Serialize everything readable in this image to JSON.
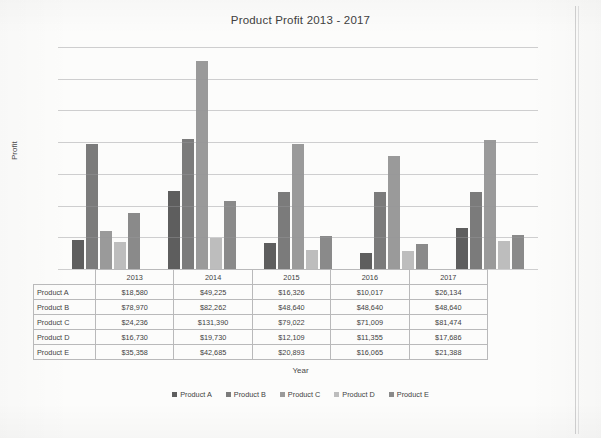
{
  "chart_data": {
    "type": "bar",
    "title": "Product Profit 2013 - 2017",
    "xlabel": "Year",
    "ylabel": "Profit",
    "categories": [
      "2013",
      "2014",
      "2015",
      "2016",
      "2017"
    ],
    "ylim": [
      0,
      140000
    ],
    "yticks": [
      0,
      20000,
      40000,
      60000,
      80000,
      100000,
      120000,
      140000
    ],
    "ytick_labels": [
      "$0",
      "$20,000",
      "$40,000",
      "$60,000",
      "$80,000",
      "$100,000",
      "$120,000",
      "$140,000"
    ],
    "grid": true,
    "legend_position": "bottom",
    "series": [
      {
        "name": "Product A",
        "color": "#5e5e5e",
        "values": [
          18580,
          49225,
          16326,
          10017,
          26134
        ]
      },
      {
        "name": "Product B",
        "color": "#7b7b7b",
        "values": [
          78970,
          82262,
          48640,
          48640,
          48640
        ]
      },
      {
        "name": "Product C",
        "color": "#9a9a9a",
        "values": [
          24236,
          131390,
          79022,
          71009,
          81474
        ]
      },
      {
        "name": "Product D",
        "color": "#bdbdbd",
        "values": [
          16730,
          19730,
          12109,
          11355,
          17686
        ]
      },
      {
        "name": "Product E",
        "color": "#8a8a8a",
        "values": [
          35358,
          42685,
          20893,
          16065,
          21388
        ]
      }
    ]
  },
  "data_table": {
    "corner": "",
    "columns": [
      "2013",
      "2014",
      "2015",
      "2016",
      "2017"
    ],
    "rows": [
      {
        "label": "Product A",
        "cells": [
          "$18,580",
          "$49,225",
          "$16,326",
          "$10,017",
          "$26,134"
        ]
      },
      {
        "label": "Product B",
        "cells": [
          "$78,970",
          "$82,262",
          "$48,640",
          "$48,640",
          "$48,640"
        ]
      },
      {
        "label": "Product C",
        "cells": [
          "$24,236",
          "$131,390",
          "$79,022",
          "$71,009",
          "$81,474"
        ]
      },
      {
        "label": "Product D",
        "cells": [
          "$16,730",
          "$19,730",
          "$12,109",
          "$11,355",
          "$17,686"
        ]
      },
      {
        "label": "Product E",
        "cells": [
          "$35,358",
          "$42,685",
          "$20,893",
          "$16,065",
          "$21,388"
        ]
      }
    ]
  }
}
